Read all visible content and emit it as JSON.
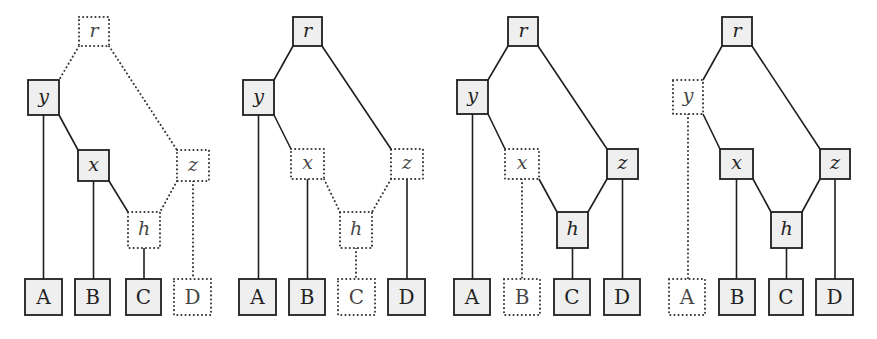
{
  "style": {
    "node_fill": "#efefef",
    "stroke": "#1e1e1e",
    "dotted_stroke": "#333333",
    "background": "#ffffff"
  },
  "edges_template": [
    {
      "from": "r",
      "to": "y",
      "kind": "diag-left"
    },
    {
      "from": "r",
      "to": "z",
      "kind": "diag-right"
    },
    {
      "from": "y",
      "to": "A",
      "kind": "vertical"
    },
    {
      "from": "y",
      "to": "x",
      "kind": "diag-right"
    },
    {
      "from": "x",
      "to": "B",
      "kind": "vertical"
    },
    {
      "from": "x",
      "to": "h",
      "kind": "diag-right"
    },
    {
      "from": "z",
      "to": "h",
      "kind": "diag-left"
    },
    {
      "from": "z",
      "to": "D",
      "kind": "vertical"
    },
    {
      "from": "h",
      "to": "C",
      "kind": "vertical"
    }
  ],
  "panels": [
    {
      "id": "panel-1",
      "nodes": [
        {
          "id": "r",
          "label": "r",
          "type": "var",
          "x": 79,
          "y": 17,
          "w": 30,
          "h": 29,
          "dotted": true
        },
        {
          "id": "y",
          "label": "y",
          "type": "var",
          "x": 28,
          "y": 80,
          "w": 31,
          "h": 35,
          "dotted": false
        },
        {
          "id": "x",
          "label": "x",
          "type": "var",
          "x": 78,
          "y": 150,
          "w": 31,
          "h": 31,
          "dotted": false
        },
        {
          "id": "z",
          "label": "z",
          "type": "var",
          "x": 177,
          "y": 150,
          "w": 32,
          "h": 31,
          "dotted": true
        },
        {
          "id": "h",
          "label": "h",
          "type": "var",
          "x": 128,
          "y": 212,
          "w": 32,
          "h": 36,
          "dotted": true
        },
        {
          "id": "A",
          "label": "A",
          "type": "leaf",
          "x": 25,
          "y": 279,
          "w": 37,
          "h": 36,
          "dotted": false
        },
        {
          "id": "B",
          "label": "B",
          "type": "leaf",
          "x": 75,
          "y": 279,
          "w": 35,
          "h": 36,
          "dotted": false
        },
        {
          "id": "C",
          "label": "C",
          "type": "leaf",
          "x": 126,
          "y": 279,
          "w": 35,
          "h": 36,
          "dotted": false
        },
        {
          "id": "D",
          "label": "D",
          "type": "leaf",
          "x": 174,
          "y": 279,
          "w": 37,
          "h": 36,
          "dotted": true
        }
      ],
      "edge_styles": {
        "r-y": "dotted",
        "r-z": "dotted",
        "y-A": "solid",
        "y-x": "solid",
        "x-B": "solid",
        "x-h": "solid",
        "z-h": "dotted",
        "z-D": "dotted",
        "h-C": "solid"
      }
    },
    {
      "id": "panel-2",
      "nodes": [
        {
          "id": "r",
          "label": "r",
          "type": "var",
          "x": 293,
          "y": 17,
          "w": 29,
          "h": 29,
          "dotted": false
        },
        {
          "id": "y",
          "label": "y",
          "type": "var",
          "x": 243,
          "y": 80,
          "w": 31,
          "h": 35,
          "dotted": false
        },
        {
          "id": "x",
          "label": "x",
          "type": "var",
          "x": 291,
          "y": 149,
          "w": 33,
          "h": 30,
          "dotted": true
        },
        {
          "id": "z",
          "label": "z",
          "type": "var",
          "x": 391,
          "y": 149,
          "w": 32,
          "h": 30,
          "dotted": true
        },
        {
          "id": "h",
          "label": "h",
          "type": "var",
          "x": 340,
          "y": 212,
          "w": 32,
          "h": 36,
          "dotted": true
        },
        {
          "id": "A",
          "label": "A",
          "type": "leaf",
          "x": 239,
          "y": 279,
          "w": 37,
          "h": 36,
          "dotted": false
        },
        {
          "id": "B",
          "label": "B",
          "type": "leaf",
          "x": 289,
          "y": 279,
          "w": 36,
          "h": 36,
          "dotted": false
        },
        {
          "id": "C",
          "label": "C",
          "type": "leaf",
          "x": 338,
          "y": 279,
          "w": 37,
          "h": 36,
          "dotted": true
        },
        {
          "id": "D",
          "label": "D",
          "type": "leaf",
          "x": 388,
          "y": 279,
          "w": 37,
          "h": 36,
          "dotted": false
        }
      ],
      "edge_styles": {
        "r-y": "solid",
        "r-z": "solid",
        "y-A": "solid",
        "y-x": "solid",
        "x-B": "solid",
        "x-h": "dotted",
        "z-h": "dotted",
        "z-D": "solid",
        "h-C": "dotted"
      }
    },
    {
      "id": "panel-3",
      "nodes": [
        {
          "id": "r",
          "label": "r",
          "type": "var",
          "x": 508,
          "y": 17,
          "w": 30,
          "h": 29,
          "dotted": false
        },
        {
          "id": "y",
          "label": "y",
          "type": "var",
          "x": 457,
          "y": 80,
          "w": 31,
          "h": 34,
          "dotted": false
        },
        {
          "id": "x",
          "label": "x",
          "type": "var",
          "x": 505,
          "y": 149,
          "w": 34,
          "h": 30,
          "dotted": true
        },
        {
          "id": "z",
          "label": "z",
          "type": "var",
          "x": 607,
          "y": 149,
          "w": 31,
          "h": 30,
          "dotted": false
        },
        {
          "id": "h",
          "label": "h",
          "type": "var",
          "x": 557,
          "y": 212,
          "w": 31,
          "h": 36,
          "dotted": false
        },
        {
          "id": "A",
          "label": "A",
          "type": "leaf",
          "x": 454,
          "y": 279,
          "w": 36,
          "h": 36,
          "dotted": false
        },
        {
          "id": "B",
          "label": "B",
          "type": "leaf",
          "x": 504,
          "y": 279,
          "w": 36,
          "h": 36,
          "dotted": true
        },
        {
          "id": "C",
          "label": "C",
          "type": "leaf",
          "x": 554,
          "y": 279,
          "w": 36,
          "h": 36,
          "dotted": false
        },
        {
          "id": "D",
          "label": "D",
          "type": "leaf",
          "x": 604,
          "y": 279,
          "w": 36,
          "h": 36,
          "dotted": false
        }
      ],
      "edge_styles": {
        "r-y": "solid",
        "r-z": "solid",
        "y-A": "solid",
        "y-x": "solid",
        "x-B": "dotted",
        "x-h": "solid",
        "z-h": "solid",
        "z-D": "solid",
        "h-C": "solid"
      }
    },
    {
      "id": "panel-4",
      "nodes": [
        {
          "id": "r",
          "label": "r",
          "type": "var",
          "x": 722,
          "y": 17,
          "w": 30,
          "h": 29,
          "dotted": false
        },
        {
          "id": "y",
          "label": "y",
          "type": "var",
          "x": 673,
          "y": 80,
          "w": 30,
          "h": 34,
          "dotted": true
        },
        {
          "id": "x",
          "label": "x",
          "type": "var",
          "x": 720,
          "y": 149,
          "w": 33,
          "h": 30,
          "dotted": false
        },
        {
          "id": "z",
          "label": "z",
          "type": "var",
          "x": 820,
          "y": 149,
          "w": 30,
          "h": 30,
          "dotted": false
        },
        {
          "id": "h",
          "label": "h",
          "type": "var",
          "x": 771,
          "y": 212,
          "w": 31,
          "h": 36,
          "dotted": false
        },
        {
          "id": "A",
          "label": "A",
          "type": "leaf",
          "x": 669,
          "y": 279,
          "w": 36,
          "h": 36,
          "dotted": true
        },
        {
          "id": "B",
          "label": "B",
          "type": "leaf",
          "x": 719,
          "y": 279,
          "w": 36,
          "h": 36,
          "dotted": false
        },
        {
          "id": "C",
          "label": "C",
          "type": "leaf",
          "x": 769,
          "y": 279,
          "w": 34,
          "h": 36,
          "dotted": false
        },
        {
          "id": "D",
          "label": "D",
          "type": "leaf",
          "x": 816,
          "y": 279,
          "w": 37,
          "h": 36,
          "dotted": false
        }
      ],
      "edge_styles": {
        "r-y": "solid",
        "r-z": "solid",
        "y-A": "dotted",
        "y-x": "solid",
        "x-B": "solid",
        "x-h": "solid",
        "z-h": "solid",
        "z-D": "solid",
        "h-C": "solid"
      }
    }
  ]
}
